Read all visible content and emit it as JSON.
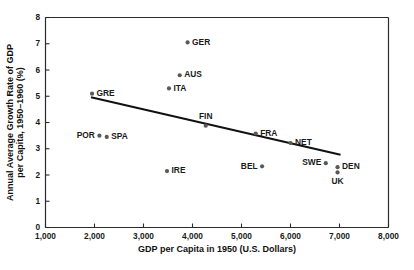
{
  "chart_data": {
    "type": "scatter",
    "title": "",
    "xlabel": "GDP per Capita in 1950 (U.S. Dollars)",
    "ylabel": "Annual Average Growth Rate of GDP per Capita, 1950–1960 (%)",
    "xlim": [
      1000,
      8000
    ],
    "ylim": [
      0,
      8
    ],
    "xticks": [
      1000,
      2000,
      3000,
      4000,
      5000,
      6000,
      7000,
      8000
    ],
    "xtick_labels": [
      "1,000",
      "2,000",
      "3,000",
      "4,000",
      "5,000",
      "6,000",
      "7,000",
      "8,000"
    ],
    "yticks": [
      0,
      1,
      2,
      3,
      4,
      5,
      6,
      7,
      8
    ],
    "ytick_labels": [
      "0",
      "1",
      "2",
      "3",
      "4",
      "5",
      "6",
      "7",
      "8"
    ],
    "grid": false,
    "legend": false,
    "marker_color": "#595959",
    "trendline_color": "#111111",
    "points": [
      {
        "label": "GRE",
        "x": 1950,
        "y": 5.1,
        "label_pos": "right"
      },
      {
        "label": "POR",
        "x": 2100,
        "y": 3.5,
        "label_pos": "left"
      },
      {
        "label": "SPA",
        "x": 2250,
        "y": 3.45,
        "label_pos": "right"
      },
      {
        "label": "IRE",
        "x": 3480,
        "y": 2.15,
        "label_pos": "right"
      },
      {
        "label": "ITA",
        "x": 3520,
        "y": 5.3,
        "label_pos": "right"
      },
      {
        "label": "AUS",
        "x": 3740,
        "y": 5.8,
        "label_pos": "right"
      },
      {
        "label": "GER",
        "x": 3900,
        "y": 7.05,
        "label_pos": "right"
      },
      {
        "label": "FIN",
        "x": 4270,
        "y": 3.88,
        "label_pos": "above"
      },
      {
        "label": "FRA",
        "x": 5290,
        "y": 3.58,
        "label_pos": "right"
      },
      {
        "label": "BEL",
        "x": 5420,
        "y": 2.33,
        "label_pos": "left"
      },
      {
        "label": "NET",
        "x": 6000,
        "y": 3.22,
        "label_pos": "right"
      },
      {
        "label": "SWE",
        "x": 6720,
        "y": 2.45,
        "label_pos": "left"
      },
      {
        "label": "DEN",
        "x": 6960,
        "y": 2.3,
        "label_pos": "right"
      },
      {
        "label": "UK",
        "x": 6960,
        "y": 2.1,
        "label_pos": "below"
      }
    ],
    "trendline": {
      "x_start": 1950,
      "y_start": 4.95,
      "x_end": 7000,
      "y_end": 2.78
    }
  }
}
